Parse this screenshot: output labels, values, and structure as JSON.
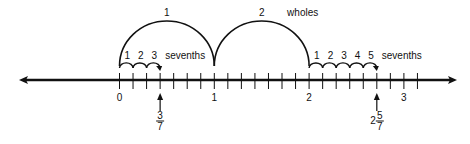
{
  "diagram": {
    "colors": {
      "ink": "#111111",
      "background": "#ffffff"
    },
    "number_line": {
      "y": 80,
      "x_start": 19,
      "x_end": 457,
      "origin_x": 119.5,
      "unit_px": 94.8,
      "subdivisions_per_unit": 7,
      "min_tick": 0,
      "max_tick_sevenths": 22,
      "tick_top": 73,
      "tick_bottom": 89,
      "arrows": [
        "left",
        "right"
      ],
      "whole_labels": [
        {
          "value": 0,
          "text": "0"
        },
        {
          "value": 1,
          "text": "1"
        },
        {
          "value": 2,
          "text": "2"
        },
        {
          "value": 3,
          "text": "3"
        }
      ]
    },
    "whole_arcs": [
      {
        "from": 0,
        "to": 1,
        "label": "1",
        "peak_y": 21
      },
      {
        "from": 1,
        "to": 2,
        "label": "2",
        "peak_y": 21
      }
    ],
    "wholes_label": "wholes",
    "hop_groups": [
      {
        "start_value": 0,
        "count": 3,
        "labels": [
          "1",
          "2",
          "3"
        ],
        "unit_label": "sevenths"
      },
      {
        "start_value": 2,
        "count": 5,
        "labels": [
          "1",
          "2",
          "3",
          "4",
          "5"
        ],
        "unit_label": "sevenths"
      }
    ],
    "markers": [
      {
        "value_sevenths": 3,
        "whole": "",
        "numerator": "3",
        "denominator": "7"
      },
      {
        "value_sevenths": 19,
        "whole": "2",
        "numerator": "5",
        "denominator": "7"
      }
    ]
  }
}
